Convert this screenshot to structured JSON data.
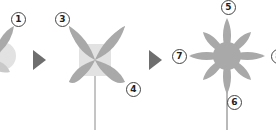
{
  "diagram": {
    "type": "step-sequence",
    "steps": [
      {
        "id": "step-1",
        "description": "partial petal shape with light center",
        "markers": [
          "1"
        ]
      },
      {
        "id": "step-2",
        "description": "four-petal flower on stem",
        "markers": [
          "3",
          "4"
        ]
      },
      {
        "id": "step-3",
        "description": "eight-petal flower on stem",
        "markers": [
          "5",
          "6",
          "7",
          "8"
        ]
      }
    ],
    "arrows": [
      {
        "from": "step-1",
        "to": "step-2",
        "icon": "arrow-right-icon"
      },
      {
        "from": "step-2",
        "to": "step-3",
        "icon": "arrow-right-icon"
      }
    ],
    "markers": {
      "m1": "1",
      "m3": "3",
      "m4": "4",
      "m5": "5",
      "m6": "6",
      "m7": "7",
      "m8": "8"
    },
    "colors": {
      "petal": "#a9a9a9",
      "center": "#e2e2e2",
      "stem": "#8a8a8a",
      "arrow": "#6e6e6e",
      "marker_border": "#444444",
      "background": "#ffffff"
    }
  }
}
